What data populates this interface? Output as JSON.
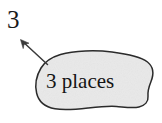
{
  "figure": {
    "background_color": "#ffffff",
    "width": 162,
    "height": 123,
    "callout_label": "3",
    "blob": {
      "text": "3 places",
      "fill_color": "#e9e9e9",
      "stroke_color": "#2b2b2b"
    },
    "arrow": {
      "name": "pointer-arrow",
      "stroke_color": "#3a3a3a",
      "direction": "up-left"
    }
  }
}
